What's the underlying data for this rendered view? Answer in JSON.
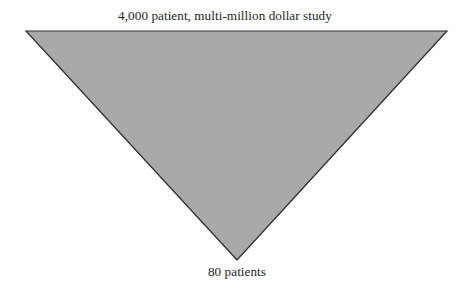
{
  "figure": {
    "type": "inverted-triangle-funnel",
    "background_color": "#ffffff",
    "shape": {
      "name": "funnel-triangle",
      "fill_color": "#a9a9a9",
      "stroke_color": "#2e2e2e",
      "stroke_width": 1.2,
      "vertices": [
        {
          "label": "top-left",
          "x": 26,
          "y": 31
        },
        {
          "label": "top-right",
          "x": 447,
          "y": 31
        },
        {
          "label": "apex-bottom",
          "x": 237,
          "y": 260
        }
      ]
    },
    "captions": {
      "top": {
        "text": "4,000 patient, multi-million dollar study",
        "position": "above-triangle-top-edge",
        "align": "center"
      },
      "bottom": {
        "text": "80 patients",
        "position": "below-triangle-apex",
        "align": "center"
      }
    }
  },
  "chart_data": {
    "type": "funnel",
    "title": "",
    "subtitle": "",
    "xlabel": "",
    "ylabel": "",
    "grid": false,
    "legend": null,
    "orientation": "vertical-inverted-triangle",
    "stages": [
      {
        "label": "4,000 patient, multi-million dollar study",
        "value": 4000,
        "unit": "patients",
        "position": "top",
        "width_px": 421
      },
      {
        "label": "80 patients",
        "value": 80,
        "unit": "patients",
        "position": "bottom",
        "width_px": 0
      }
    ],
    "annotations": [
      {
        "text": "4,000 patient, multi-million dollar study",
        "anchor": "top"
      },
      {
        "text": "80 patients",
        "anchor": "bottom"
      }
    ],
    "colors": {
      "fill": "#a9a9a9",
      "outline": "#2e2e2e",
      "background": "#ffffff",
      "text": "#1f1f1f"
    }
  }
}
